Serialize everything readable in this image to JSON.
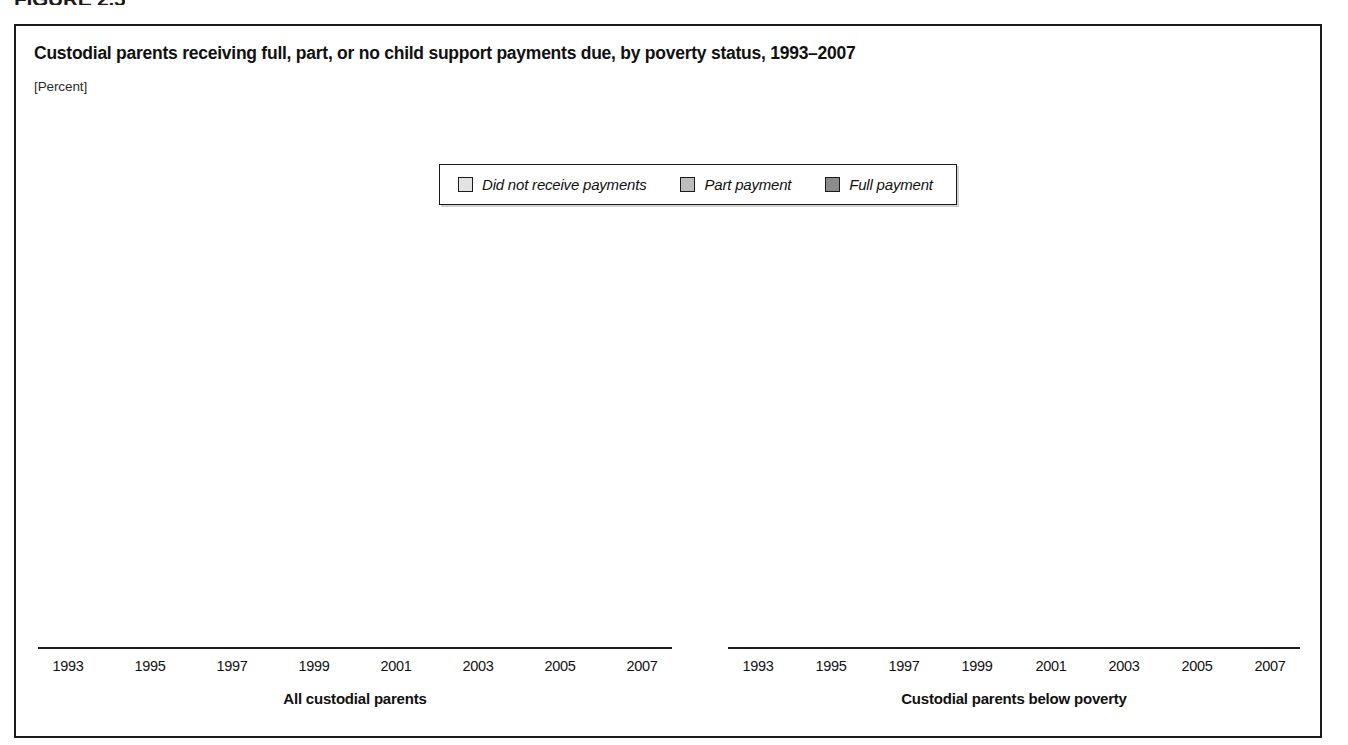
{
  "figure_header": "FIGURE 2.5",
  "figure": {
    "title": "Custodial parents receiving full, part, or no child support payments due, by poverty status, 1993–2007",
    "subtitle": "[Percent]"
  },
  "legend": {
    "items": [
      {
        "label": "Did not receive payments",
        "key": "none",
        "color": "#e3e3e3"
      },
      {
        "label": "Part payment",
        "key": "part",
        "color": "#bdbdbd"
      },
      {
        "label": "Full payment",
        "key": "full",
        "color": "#8b8b8b"
      }
    ]
  },
  "chart_data": {
    "type": "bar",
    "title": "Custodial parents receiving full, part, or no child support payments due, by poverty status, 1993–2007",
    "subtitle": "[Percent]",
    "stacked": true,
    "stack_order_bottom_to_top": [
      "Full payment",
      "Part payment",
      "Did not receive payments"
    ],
    "xlabel": "",
    "ylabel": "Percent",
    "ylim": [
      0,
      100
    ],
    "grid": false,
    "legend_position": "top-center",
    "categories": [
      "1993",
      "1995",
      "1997",
      "1999",
      "2001",
      "2003",
      "2005",
      "2007"
    ],
    "panels": [
      {
        "name": "All custodial parents",
        "categories": [
          "1993",
          "1995",
          "1997",
          "1999",
          "2001",
          "2003",
          "2005",
          "2007"
        ],
        "series": [
          {
            "name": "Did not receive payments",
            "color": "#e3e3e3",
            "values": [
              24.2,
              24.3,
              24.7,
              26.3,
              26.0,
              23.6,
              22.8,
              23.7
            ]
          },
          {
            "name": "Part payment",
            "color": "#bdbdbd",
            "values": [
              38.9,
              33.4,
              29.1,
              28.6,
              29.2,
              31.1,
              30.3,
              29.5
            ]
          },
          {
            "name": "Full payment",
            "color": "#8b8b8b",
            "values": [
              36.9,
              42.3,
              46.2,
              45.1,
              44.8,
              45.3,
              46.9,
              46.8
            ]
          }
        ]
      },
      {
        "name": "Custodial parents below poverty",
        "categories": [
          "1993",
          "1995",
          "1997",
          "1999",
          "2001",
          "2003",
          "2005",
          "2007"
        ],
        "series": [
          {
            "name": "Did not receive payments",
            "color": "#e3e3e3",
            "values": [
              29.5,
              33.0,
              36.5,
              35.9,
              34.5,
              31.3,
              27.4,
              30.7
            ]
          },
          {
            "name": "Part payment",
            "color": "#bdbdbd",
            "values": [
              44.1,
              38.7,
              33.7,
              32.1,
              34.7,
              33.5,
              33.0,
              29.1
            ]
          },
          {
            "name": "Full payment",
            "color": "#8b8b8b",
            "values": [
              26.4,
              28.3,
              29.8,
              32.0,
              30.8,
              35.2,
              39.6,
              40.2
            ]
          }
        ]
      }
    ]
  }
}
